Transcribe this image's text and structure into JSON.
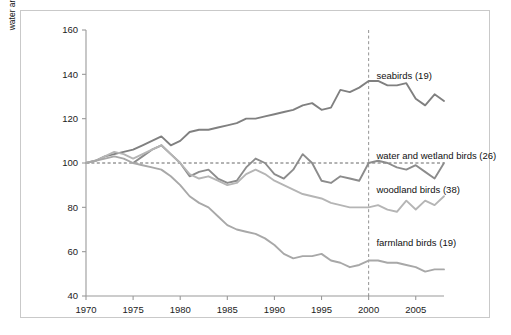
{
  "figure": {
    "ylabel_line1": "index (1970 = 100)",
    "ylabel_line2": "water and wetland birds (1975 = 100)"
  },
  "chart_data": {
    "type": "line",
    "title": "",
    "xlabel": "",
    "ylabel": "index (1970 = 100) / water and wetland birds (1975 = 100)",
    "xlim": [
      1970,
      2008
    ],
    "ylim": [
      40,
      160
    ],
    "xticks": [
      1970,
      1975,
      1980,
      1985,
      1990,
      1995,
      2000,
      2005
    ],
    "yticks": [
      40,
      60,
      80,
      100,
      120,
      140,
      160
    ],
    "grid": false,
    "legend_position": "inline-right",
    "reference_lines": [
      {
        "type": "horizontal",
        "value": 100,
        "style": "dashed"
      },
      {
        "type": "vertical",
        "value": 2000,
        "style": "dashed"
      }
    ],
    "series": [
      {
        "name": "seabirds (19)",
        "color": "#808080",
        "label_x": 2000.4,
        "label_y": 139.5,
        "x": [
          1970,
          1971,
          1972,
          1973,
          1974,
          1975,
          1976,
          1977,
          1978,
          1979,
          1980,
          1981,
          1982,
          1983,
          1984,
          1985,
          1986,
          1987,
          1988,
          1989,
          1990,
          1991,
          1992,
          1993,
          1994,
          1995,
          1996,
          1997,
          1998,
          1999,
          2000,
          2001,
          2002,
          2003,
          2004,
          2005,
          2006,
          2007,
          2008
        ],
        "y": [
          100,
          101,
          103,
          104,
          105,
          106,
          108,
          110,
          112,
          108,
          110,
          114,
          115,
          115,
          116,
          117,
          118,
          120,
          120,
          121,
          122,
          123,
          124,
          126,
          127,
          124,
          125,
          133,
          132,
          134,
          137,
          137,
          135,
          135,
          136,
          129,
          126,
          131,
          128
        ]
      },
      {
        "name": "water and wetland birds (26)",
        "color": "#8c8c8c",
        "label_x": 2000.4,
        "label_y": 103.5,
        "x": [
          1975,
          1976,
          1977,
          1978,
          1979,
          1980,
          1981,
          1982,
          1983,
          1984,
          1985,
          1986,
          1987,
          1988,
          1989,
          1990,
          1991,
          1992,
          1993,
          1994,
          1995,
          1996,
          1997,
          1998,
          1999,
          2000,
          2001,
          2002,
          2003,
          2004,
          2005,
          2006,
          2007,
          2008
        ],
        "y": [
          100,
          103,
          106,
          108,
          104,
          100,
          94,
          96,
          97,
          93,
          91,
          92,
          98,
          102,
          100,
          95,
          93,
          97,
          104,
          100,
          92,
          91,
          94,
          93,
          92,
          100,
          101,
          100,
          98,
          97,
          99,
          96,
          93,
          100
        ]
      },
      {
        "name": "woodland birds (38)",
        "color": "#b5b5b5",
        "label_x": 2000.4,
        "label_y": 88.0,
        "x": [
          1970,
          1971,
          1972,
          1973,
          1974,
          1975,
          1976,
          1977,
          1978,
          1979,
          1980,
          1981,
          1982,
          1983,
          1984,
          1985,
          1986,
          1987,
          1988,
          1989,
          1990,
          1991,
          1992,
          1993,
          1994,
          1995,
          1996,
          1997,
          1998,
          1999,
          2000,
          2001,
          2002,
          2003,
          2004,
          2005,
          2006,
          2007,
          2008
        ],
        "y": [
          100,
          101,
          103,
          105,
          104,
          102,
          104,
          106,
          108,
          104,
          100,
          95,
          93,
          94,
          92,
          90,
          91,
          95,
          97,
          95,
          92,
          90,
          88,
          86,
          85,
          84,
          82,
          81,
          80,
          80,
          80,
          81,
          79,
          78,
          83,
          79,
          83,
          81,
          85
        ]
      },
      {
        "name": "farmland birds (19)",
        "color": "#a8a8a8",
        "label_x": 2000.4,
        "label_y": 64.0,
        "x": [
          1970,
          1971,
          1972,
          1973,
          1974,
          1975,
          1976,
          1977,
          1978,
          1979,
          1980,
          1981,
          1982,
          1983,
          1984,
          1985,
          1986,
          1987,
          1988,
          1989,
          1990,
          1991,
          1992,
          1993,
          1994,
          1995,
          1996,
          1997,
          1998,
          1999,
          2000,
          2001,
          2002,
          2003,
          2004,
          2005,
          2006,
          2007,
          2008
        ],
        "y": [
          100,
          101,
          102,
          103,
          102,
          100,
          99,
          98,
          97,
          94,
          90,
          85,
          82,
          80,
          76,
          72,
          70,
          69,
          68,
          66,
          63,
          59,
          57,
          58,
          58,
          59,
          56,
          55,
          53,
          54,
          56,
          56,
          55,
          55,
          54,
          53,
          51,
          52,
          52
        ]
      }
    ]
  }
}
